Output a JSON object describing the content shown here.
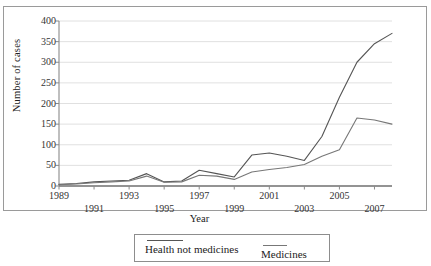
{
  "chart_data": {
    "type": "line",
    "title": "",
    "xlabel": "Year",
    "ylabel": "Number of cases",
    "xlim": [
      1989,
      2008
    ],
    "ylim": [
      0,
      400
    ],
    "ytick_values": [
      0,
      50,
      100,
      150,
      200,
      250,
      300,
      350,
      400
    ],
    "ytick_labels": [
      "0",
      "50",
      "100",
      "150",
      "200",
      "250",
      "300",
      "350",
      "400"
    ],
    "xtick_values": [
      1989,
      1991,
      1993,
      1995,
      1997,
      1999,
      2001,
      2003,
      2005,
      2007
    ],
    "xtick_labels": [
      "1989",
      "1991",
      "1993",
      "1995",
      "1997",
      "1999",
      "2001",
      "2003",
      "2005",
      "2007"
    ],
    "grid": "horizontal",
    "legend_position": "bottom",
    "x": [
      1989,
      1990,
      1991,
      1992,
      1993,
      1994,
      1995,
      1996,
      1997,
      1998,
      1999,
      2000,
      2001,
      2002,
      2003,
      2004,
      2005,
      2006,
      2007,
      2008
    ],
    "series": [
      {
        "name": "Health not medicines",
        "color": "#555555",
        "values": [
          4,
          6,
          10,
          12,
          14,
          30,
          10,
          12,
          38,
          30,
          22,
          75,
          80,
          72,
          62,
          120,
          215,
          300,
          345,
          370
        ]
      },
      {
        "name": "Medicines",
        "color": "#777777",
        "values": [
          3,
          5,
          8,
          10,
          12,
          24,
          9,
          10,
          26,
          24,
          16,
          34,
          40,
          45,
          52,
          72,
          88,
          165,
          160,
          150
        ]
      }
    ]
  },
  "legend": {
    "items": [
      {
        "label": "Health not medicines"
      },
      {
        "label": "Medicines"
      }
    ]
  },
  "axes": {
    "y_title": "Number of cases",
    "x_title": "Year"
  }
}
